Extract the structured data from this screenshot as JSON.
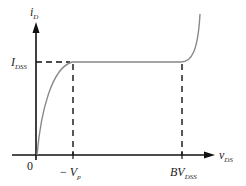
{
  "diagram": {
    "y_axis": {
      "symbol": "i",
      "subscript": "D"
    },
    "x_axis": {
      "symbol": "v",
      "subscript": "DS"
    },
    "origin_label": "0",
    "level_label": {
      "symbol": "I",
      "subscript": "DSS"
    },
    "tick_labels": [
      {
        "prefix": "− ",
        "symbol": "V",
        "subscript": "p"
      },
      {
        "prefix": "",
        "symbol": "BV",
        "subscript": "DSS"
      }
    ],
    "colors": {
      "axis": "#111111",
      "curve": "#888888",
      "dashed": "#111111",
      "text": "#222222"
    }
  }
}
